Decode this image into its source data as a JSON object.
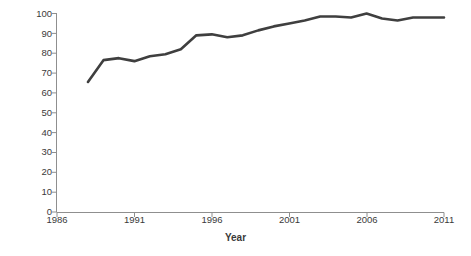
{
  "chart_data": {
    "type": "line",
    "title": "",
    "xlabel": "Year",
    "ylabel": "% Compliance",
    "xlim": [
      1986,
      2011
    ],
    "ylim": [
      0,
      100
    ],
    "grid": false,
    "legend": null,
    "line_color": "#3f3f3f",
    "x_ticks": [
      "1986",
      "1991",
      "1996",
      "2001",
      "2006",
      "2011"
    ],
    "x_tick_values": [
      1986,
      1991,
      1996,
      2001,
      2006,
      2011
    ],
    "y_ticks": [
      "0",
      "10",
      "20",
      "30",
      "40",
      "50",
      "60",
      "70",
      "80",
      "90",
      "100"
    ],
    "y_tick_values": [
      0,
      10,
      20,
      30,
      40,
      50,
      60,
      70,
      80,
      90,
      100
    ],
    "series": [
      {
        "name": "% Compliance",
        "x": [
          1988,
          1989,
          1990,
          1991,
          1992,
          1993,
          1994,
          1995,
          1996,
          1997,
          1998,
          1999,
          2000,
          2001,
          2002,
          2003,
          2004,
          2005,
          2006,
          2007,
          2008,
          2009,
          2010,
          2011
        ],
        "values": [
          65.5,
          76.5,
          77.5,
          76.0,
          78.5,
          79.5,
          82.0,
          89.0,
          89.5,
          88.0,
          89.0,
          91.5,
          93.5,
          95.0,
          96.5,
          98.5,
          98.5,
          98.0,
          100.0,
          97.5,
          96.5,
          98.0,
          98.0,
          98.0
        ]
      }
    ]
  },
  "axis": {
    "x_title": "Year",
    "y_title": "% Compliance"
  }
}
